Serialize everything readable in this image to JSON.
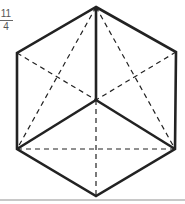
{
  "label": {
    "numerator": "11",
    "denominator": "4"
  },
  "figure": {
    "name": "hexagon-cube-projection",
    "vertices": {
      "top": [
        96,
        7
      ],
      "upper_right": [
        176,
        52
      ],
      "lower_right": [
        175,
        149
      ],
      "bottom": [
        96,
        196
      ],
      "lower_left": [
        17,
        149
      ],
      "upper_left": [
        17,
        53
      ],
      "center": [
        96,
        100
      ]
    },
    "solid_lines": [
      [
        "top",
        "upper_right"
      ],
      [
        "upper_right",
        "lower_right"
      ],
      [
        "lower_right",
        "bottom"
      ],
      [
        "bottom",
        "lower_left"
      ],
      [
        "lower_left",
        "upper_left"
      ],
      [
        "upper_left",
        "top"
      ],
      [
        "center",
        "top"
      ],
      [
        "center",
        "lower_left"
      ],
      [
        "center",
        "lower_right"
      ]
    ],
    "dashed_lines": [
      [
        "top",
        "lower_left"
      ],
      [
        "top",
        "lower_right"
      ],
      [
        "upper_left",
        "center"
      ],
      [
        "upper_right",
        "center"
      ],
      [
        "lower_left",
        "lower_right"
      ],
      [
        "center",
        "bottom"
      ]
    ],
    "stroke_color": "#222222"
  }
}
